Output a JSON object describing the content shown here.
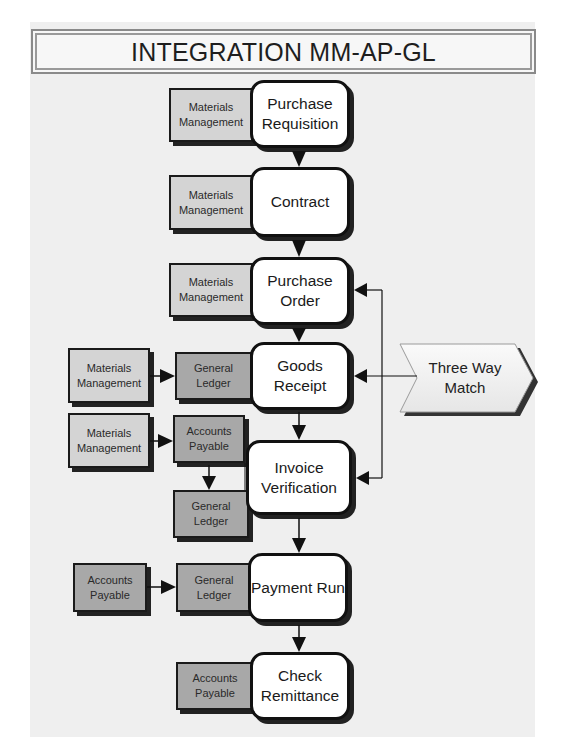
{
  "title": "INTEGRATION MM-AP-GL",
  "process_steps": [
    {
      "id": "purchase-requisition",
      "lines": [
        "Purchase",
        "Requisition"
      ]
    },
    {
      "id": "contract",
      "lines": [
        "Contract"
      ]
    },
    {
      "id": "purchase-order",
      "lines": [
        "Purchase",
        "Order"
      ]
    },
    {
      "id": "goods-receipt",
      "lines": [
        "Goods",
        "Receipt"
      ]
    },
    {
      "id": "invoice-verification",
      "lines": [
        "Invoice",
        "Verification"
      ]
    },
    {
      "id": "payment-run",
      "lines": [
        "Payment Run"
      ]
    },
    {
      "id": "check-remittance",
      "lines": [
        "Check",
        "Remittance"
      ]
    }
  ],
  "modules": {
    "pr_mm": [
      "Materials",
      "Management"
    ],
    "contract_mm": [
      "Materials",
      "Management"
    ],
    "po_mm": [
      "Materials",
      "Management"
    ],
    "gr_mm": [
      "Materials",
      "Management"
    ],
    "gr_gl": [
      "General",
      "Ledger"
    ],
    "iv_mm": [
      "Materials",
      "Management"
    ],
    "iv_ap": [
      "Accounts",
      "Payable"
    ],
    "iv_gl": [
      "General",
      "Ledger"
    ],
    "pay_ap": [
      "Accounts",
      "Payable"
    ],
    "pay_gl": [
      "General",
      "Ledger"
    ],
    "check_ap": [
      "Accounts",
      "Payable"
    ]
  },
  "side_note": {
    "lines": [
      "Three Way",
      "Match"
    ]
  },
  "colors": {
    "materials_management": "#d4d4d4",
    "accounts_payable": "#a8a8a8",
    "general_ledger": "#a8a8a8",
    "panel_background": "#efefef"
  }
}
